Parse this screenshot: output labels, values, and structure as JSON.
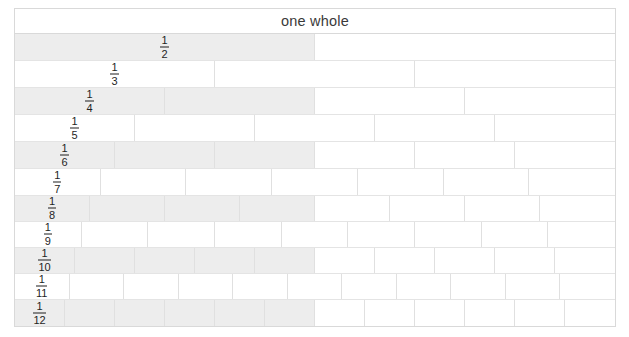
{
  "diagram": {
    "header_label": "one whole",
    "colors": {
      "shaded_cell": "#ededed",
      "unshaded_cell": "#ffffff",
      "border": "#e0e0e0",
      "outer_border": "#d9d9d9",
      "text": "#1f1f1f",
      "header_text": "#3a3a3a",
      "page_background": "#ffffff"
    },
    "rows": [
      {
        "denominator": 2,
        "numerator": "1",
        "den_text": "2",
        "label": "1/2",
        "cells": 2,
        "shaded_cells": 1,
        "shaded": true
      },
      {
        "denominator": 3,
        "numerator": "1",
        "den_text": "3",
        "label": "1/3",
        "cells": 3,
        "shaded_cells": 0,
        "shaded": false
      },
      {
        "denominator": 4,
        "numerator": "1",
        "den_text": "4",
        "label": "1/4",
        "cells": 4,
        "shaded_cells": 2,
        "shaded": true
      },
      {
        "denominator": 5,
        "numerator": "1",
        "den_text": "5",
        "label": "1/5",
        "cells": 5,
        "shaded_cells": 0,
        "shaded": false
      },
      {
        "denominator": 6,
        "numerator": "1",
        "den_text": "6",
        "label": "1/6",
        "cells": 6,
        "shaded_cells": 3,
        "shaded": true
      },
      {
        "denominator": 7,
        "numerator": "1",
        "den_text": "7",
        "label": "1/7",
        "cells": 7,
        "shaded_cells": 0,
        "shaded": false
      },
      {
        "denominator": 8,
        "numerator": "1",
        "den_text": "8",
        "label": "1/8",
        "cells": 8,
        "shaded_cells": 4,
        "shaded": true
      },
      {
        "denominator": 9,
        "numerator": "1",
        "den_text": "9",
        "label": "1/9",
        "cells": 9,
        "shaded_cells": 0,
        "shaded": false
      },
      {
        "denominator": 10,
        "numerator": "1",
        "den_text": "10",
        "label": "1/10",
        "cells": 10,
        "shaded_cells": 5,
        "shaded": true
      },
      {
        "denominator": 11,
        "numerator": "1",
        "den_text": "11",
        "label": "1/11",
        "cells": 11,
        "shaded_cells": 0,
        "shaded": false
      },
      {
        "denominator": 12,
        "numerator": "1",
        "den_text": "12",
        "label": "1/12",
        "cells": 12,
        "shaded_cells": 6,
        "shaded": true
      }
    ]
  },
  "chart_data": {
    "type": "bar",
    "title": "one whole",
    "xlabel": "",
    "ylabel": "",
    "categories": [
      "1/2",
      "1/3",
      "1/4",
      "1/5",
      "1/6",
      "1/7",
      "1/8",
      "1/9",
      "1/10",
      "1/11",
      "1/12"
    ],
    "values": [
      0.5,
      0.3333,
      0.25,
      0.2,
      0.1667,
      0.1429,
      0.125,
      0.1111,
      0.1,
      0.0909,
      0.0833
    ],
    "xlim": [
      0,
      1
    ],
    "grid": false,
    "legend": null,
    "annotations": [
      "Each row is one whole divided into n equal parts",
      "Left half of every even-denominator row is shaded"
    ]
  }
}
